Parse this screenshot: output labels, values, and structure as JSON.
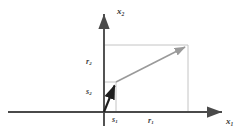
{
  "figure": {
    "background": "#ffffff"
  },
  "axes": {
    "x_axis": {
      "label": "x",
      "sub": "1",
      "name": "horizontal-axis",
      "from_px": [
        8,
        112
      ],
      "to_px": [
        228,
        112
      ],
      "color": "#4a4a4a"
    },
    "y_axis": {
      "label": "x",
      "sub": "2",
      "name": "vertical-axis",
      "from_px": [
        104,
        126
      ],
      "to_px": [
        104,
        8
      ],
      "color": "#4a4a4a"
    },
    "origin_px": [
      104,
      112
    ]
  },
  "vectors": [
    {
      "name": "vector-s",
      "style": "dark",
      "color": "#1e1e1e",
      "tail_px": [
        104,
        112
      ],
      "head_px": [
        116,
        82
      ],
      "components": {
        "x": "s1",
        "y": "s2"
      }
    },
    {
      "name": "vector-r",
      "style": "gray",
      "color": "#9a9a9a",
      "tail_px": [
        116,
        82
      ],
      "head_px": [
        188,
        45
      ],
      "components": {
        "x": "r1",
        "y": "r2"
      }
    }
  ],
  "guides": [
    {
      "name": "guide-s2-horizontal",
      "from_px": [
        104,
        82
      ],
      "to_px": [
        116,
        82
      ],
      "color": "#c4c4c4"
    },
    {
      "name": "guide-s1-vertical",
      "from_px": [
        116,
        82
      ],
      "to_px": [
        116,
        112
      ],
      "color": "#c4c4c4"
    },
    {
      "name": "guide-r2-horizontal",
      "from_px": [
        104,
        45
      ],
      "to_px": [
        188,
        45
      ],
      "color": "#c4c4c4"
    },
    {
      "name": "guide-r1-vertical",
      "from_px": [
        188,
        45
      ],
      "to_px": [
        188,
        112
      ],
      "color": "#c4c4c4"
    }
  ],
  "labels": {
    "x_axis": {
      "base": "x",
      "sub": "1"
    },
    "y_axis": {
      "base": "x",
      "sub": "2"
    },
    "r2": {
      "base": "r",
      "sub": "2"
    },
    "s2": {
      "base": "s",
      "sub": "2"
    },
    "s1": {
      "base": "s",
      "sub": "1"
    },
    "r1": {
      "base": "r",
      "sub": "1"
    }
  },
  "colors": {
    "axis": "#4a4a4a",
    "guide": "#c4c4c4",
    "vector_dark": "#1e1e1e",
    "vector_gray": "#9a9a9a",
    "text": "#3a3a3a",
    "background": "#ffffff"
  }
}
